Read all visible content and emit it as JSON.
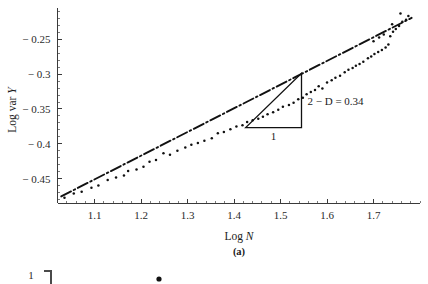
{
  "figure": {
    "panel_label": "(a)"
  },
  "chart_data": {
    "type": "scatter",
    "title": "",
    "xlabel_prefix": "Log ",
    "xlabel_var": "N",
    "ylabel_prefix": "Log var ",
    "ylabel_var": "Y",
    "xlim": [
      1.02,
      1.8
    ],
    "ylim": [
      -0.485,
      -0.205
    ],
    "xticks": [
      1.1,
      1.2,
      1.3,
      1.4,
      1.5,
      1.6,
      1.7
    ],
    "xtick_labels": [
      "1.1",
      "1.2",
      "1.3",
      "1.4",
      "1.5",
      "1.6",
      "1.7"
    ],
    "yticks": [
      -0.25,
      -0.3,
      -0.35,
      -0.4,
      -0.45
    ],
    "ytick_labels": [
      "-0.25",
      "-0.3",
      "-0.35",
      "-0.4",
      "-0.45"
    ],
    "x_minor_step": 0.02,
    "y_minor_step": 0.01,
    "grid": false,
    "legend": null,
    "fit_line": {
      "style": "dash-dot",
      "slope": 0.34,
      "x_start": 1.028,
      "y_start": -0.4755,
      "x_end": 1.782,
      "y_end": -0.2191
    },
    "points": [
      [
        1.035,
        -0.4775
      ],
      [
        1.055,
        -0.4712
      ],
      [
        1.072,
        -0.469
      ],
      [
        1.093,
        -0.4632
      ],
      [
        1.108,
        -0.4598
      ],
      [
        1.128,
        -0.452
      ],
      [
        1.146,
        -0.4483
      ],
      [
        1.163,
        -0.4455
      ],
      [
        1.172,
        -0.439
      ],
      [
        1.19,
        -0.4368
      ],
      [
        1.205,
        -0.433
      ],
      [
        1.218,
        -0.4258
      ],
      [
        1.232,
        -0.4232
      ],
      [
        1.248,
        -0.4135
      ],
      [
        1.262,
        -0.4158
      ],
      [
        1.278,
        -0.4098
      ],
      [
        1.295,
        -0.4052
      ],
      [
        1.308,
        -0.4015
      ],
      [
        1.322,
        -0.3988
      ],
      [
        1.336,
        -0.3955
      ],
      [
        1.352,
        -0.3922
      ],
      [
        1.365,
        -0.3848
      ],
      [
        1.378,
        -0.3832
      ],
      [
        1.392,
        -0.379
      ],
      [
        1.405,
        -0.3752
      ],
      [
        1.418,
        -0.3735
      ],
      [
        1.428,
        -0.3688
      ],
      [
        1.44,
        -0.3662
      ],
      [
        1.452,
        -0.364
      ],
      [
        1.462,
        -0.3612
      ],
      [
        1.472,
        -0.3575
      ],
      [
        1.484,
        -0.3548
      ],
      [
        1.495,
        -0.3512
      ],
      [
        1.505,
        -0.3468
      ],
      [
        1.518,
        -0.3442
      ],
      [
        1.528,
        -0.341
      ],
      [
        1.538,
        -0.3362
      ],
      [
        1.548,
        -0.3338
      ],
      [
        1.556,
        -0.3288
      ],
      [
        1.565,
        -0.3255
      ],
      [
        1.574,
        -0.3228
      ],
      [
        1.582,
        -0.3172
      ],
      [
        1.59,
        -0.3205
      ],
      [
        1.6,
        -0.3118
      ],
      [
        1.61,
        -0.3088
      ],
      [
        1.618,
        -0.3052
      ],
      [
        1.628,
        -0.3022
      ],
      [
        1.638,
        -0.2972
      ],
      [
        1.646,
        -0.2938
      ],
      [
        1.655,
        -0.2912
      ],
      [
        1.662,
        -0.288
      ],
      [
        1.67,
        -0.2855
      ],
      [
        1.678,
        -0.2822
      ],
      [
        1.688,
        -0.2772
      ],
      [
        1.695,
        -0.2748
      ],
      [
        1.702,
        -0.2712
      ],
      [
        1.71,
        -0.268
      ],
      [
        1.718,
        -0.2652
      ],
      [
        1.726,
        -0.2618
      ],
      [
        1.732,
        -0.2575
      ],
      [
        1.7,
        -0.2528
      ],
      [
        1.712,
        -0.2472
      ],
      [
        1.722,
        -0.2432
      ],
      [
        1.736,
        -0.2455
      ],
      [
        1.742,
        -0.2392
      ],
      [
        1.748,
        -0.2352
      ],
      [
        1.74,
        -0.2282
      ],
      [
        1.755,
        -0.2308
      ],
      [
        1.762,
        -0.2248
      ],
      [
        1.77,
        -0.2218
      ],
      [
        1.775,
        -0.2165
      ],
      [
        1.758,
        -0.2128
      ]
    ]
  },
  "annotation": {
    "slope_text": "2 − D = 0.34",
    "base_label": "1",
    "triangle": {
      "x_left": 1.425,
      "x_right": 1.545,
      "y_bottom": -0.3768,
      "y_top": -0.2988
    }
  },
  "next_figure_fragment": {
    "tick_label": "1"
  }
}
